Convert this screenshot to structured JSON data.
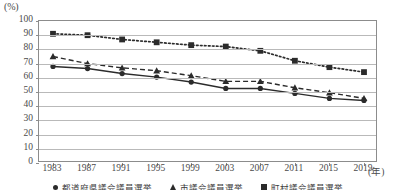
{
  "axis": {
    "y_unit_label": "(%)",
    "y_ticks": [
      "100",
      "90",
      "80",
      "70",
      "60",
      "50",
      "40",
      "30",
      "20",
      "10",
      "0"
    ],
    "x_ticks": [
      "1983",
      "1987",
      "1991",
      "1995",
      "1999",
      "2003",
      "2007",
      "2011",
      "2015",
      "2019"
    ],
    "x_unit_label": "(年)"
  },
  "legend": {
    "items": [
      {
        "label": "都道府県議会議員選挙",
        "marker": "circle-marker",
        "style": "solid",
        "color": "#2b2b2b"
      },
      {
        "label": "市議会議員選挙",
        "marker": "triangle-marker",
        "style": "dashed",
        "color": "#2b2b2b"
      },
      {
        "label": "町村議会議員選挙",
        "marker": "square-marker",
        "style": "dotted",
        "color": "#2b2b2b"
      }
    ]
  },
  "chart_data": {
    "type": "line",
    "title": "",
    "xlabel": "(年)",
    "ylabel": "(%)",
    "ylim": [
      0,
      100
    ],
    "yticks": [
      0,
      10,
      20,
      30,
      40,
      50,
      60,
      70,
      80,
      90,
      100
    ],
    "grid": true,
    "legend_position": "bottom",
    "categories": [
      "1983",
      "1987",
      "1991",
      "1995",
      "1999",
      "2003",
      "2007",
      "2011",
      "2015",
      "2019"
    ],
    "series": [
      {
        "name": "都道府県議会議員選挙",
        "marker": "circle",
        "style": "solid",
        "color": "#2b2b2b",
        "values": [
          68.0,
          66.5,
          63.0,
          60.5,
          57.0,
          52.5,
          52.5,
          49.0,
          45.5,
          44.0
        ]
      },
      {
        "name": "市議会議員選挙",
        "marker": "triangle",
        "style": "dashed",
        "color": "#2b2b2b",
        "values": [
          75.0,
          70.0,
          67.0,
          65.0,
          61.5,
          57.5,
          57.5,
          53.0,
          49.5,
          45.5
        ]
      },
      {
        "name": "町村議会議員選挙",
        "marker": "square",
        "style": "dotted",
        "color": "#2b2b2b",
        "values": [
          91.0,
          90.0,
          87.0,
          85.0,
          83.0,
          82.0,
          79.0,
          72.0,
          67.5,
          64.0
        ]
      }
    ]
  }
}
